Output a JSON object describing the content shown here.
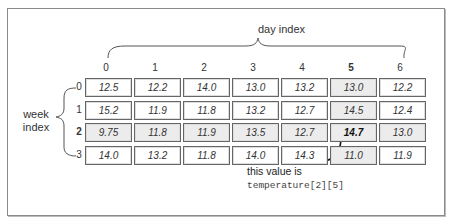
{
  "column_axis": {
    "label": "day index",
    "indices": [
      "0",
      "1",
      "2",
      "3",
      "4",
      "5",
      "6"
    ],
    "highlighted_index": 5
  },
  "row_axis": {
    "label_line1": "week",
    "label_line2": "index",
    "indices": [
      "0",
      "1",
      "2",
      "3"
    ],
    "highlighted_index": 2
  },
  "table": {
    "rows": [
      [
        "12.5",
        "12.2",
        "14.0",
        "13.0",
        "13.2",
        "13.0",
        "12.2"
      ],
      [
        "15.2",
        "11.9",
        "11.8",
        "13.2",
        "12.7",
        "14.5",
        "12.4"
      ],
      [
        "9.75",
        "11.8",
        "11.9",
        "13.5",
        "12.7",
        "14.7",
        "13.0"
      ],
      [
        "14.0",
        "13.2",
        "11.8",
        "14.0",
        "14.3",
        "11.0",
        "11.9"
      ]
    ],
    "highlight_row": 2,
    "highlight_col": 5,
    "highlight_color": "#ececec"
  },
  "annotation": {
    "text": "this value is",
    "code": "temperature[2][5]",
    "target_row": 2,
    "target_col": 5
  }
}
